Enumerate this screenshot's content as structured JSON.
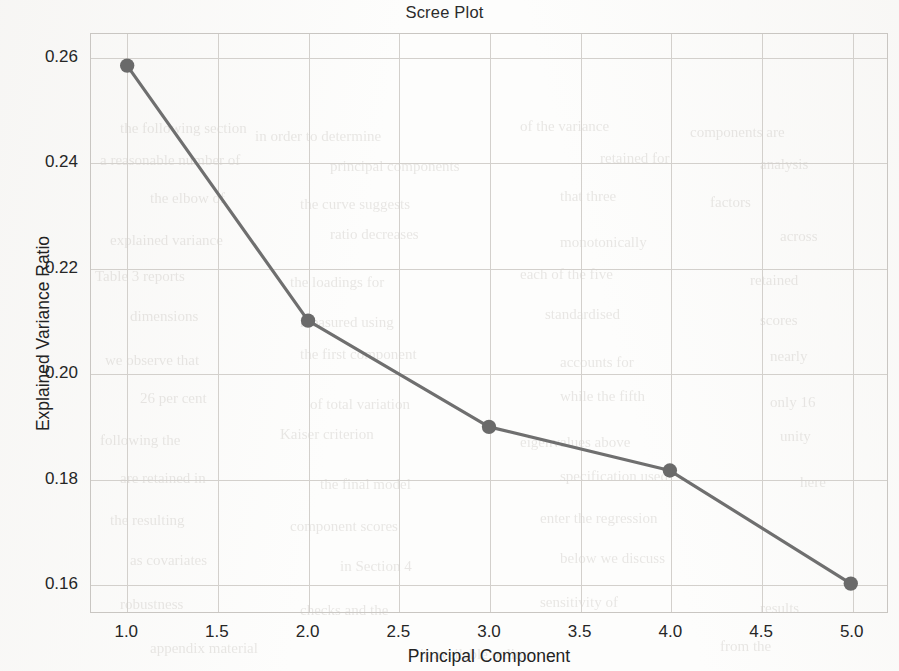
{
  "chart_data": {
    "type": "line",
    "title": "Scree Plot",
    "xlabel": "Principal Component",
    "ylabel": "Explained Variance Ratio",
    "x": [
      1,
      2,
      3,
      4,
      5
    ],
    "values": [
      0.2585,
      0.21,
      0.1898,
      0.1815,
      0.16
    ],
    "series": [
      {
        "name": "Explained Variance Ratio",
        "x": [
          1,
          2,
          3,
          4,
          5
        ],
        "values": [
          0.2585,
          0.21,
          0.1898,
          0.1815,
          0.16
        ]
      }
    ],
    "xlim": [
      0.8,
      5.2
    ],
    "ylim": [
      0.1545,
      0.2645
    ],
    "xticks": [
      1.0,
      1.5,
      2.0,
      2.5,
      3.0,
      3.5,
      4.0,
      4.5,
      5.0
    ],
    "xtick_labels": [
      "1.0",
      "1.5",
      "2.0",
      "2.5",
      "3.0",
      "3.5",
      "4.0",
      "4.5",
      "5.0"
    ],
    "yticks": [
      0.16,
      0.18,
      0.2,
      0.22,
      0.24,
      0.26
    ],
    "ytick_labels": [
      "0.16",
      "0.18",
      "0.20",
      "0.22",
      "0.24",
      "0.26"
    ],
    "grid": true,
    "legend": false,
    "marker": "circle",
    "line_color": "#6f6f6f",
    "marker_color": "#6a6a6a",
    "grid_color": "#d3d0cc",
    "axes_color": "#c9c6c2",
    "text_color": "#262626"
  },
  "background_bleed": [
    {
      "text": "the following section",
      "x": 120,
      "y": 120,
      "size": 15,
      "rot": 0
    },
    {
      "text": "in order to determine",
      "x": 255,
      "y": 128,
      "size": 15,
      "rot": 0
    },
    {
      "text": "of the variance",
      "x": 520,
      "y": 118,
      "size": 15,
      "rot": 0
    },
    {
      "text": "components are",
      "x": 690,
      "y": 124,
      "size": 15,
      "rot": 0
    },
    {
      "text": "a reasonable number of",
      "x": 100,
      "y": 152,
      "size": 15,
      "rot": 0
    },
    {
      "text": "principal components",
      "x": 330,
      "y": 158,
      "size": 15,
      "rot": 0
    },
    {
      "text": "retained for",
      "x": 600,
      "y": 150,
      "size": 15,
      "rot": 0
    },
    {
      "text": "analysis",
      "x": 760,
      "y": 156,
      "size": 15,
      "rot": 0
    },
    {
      "text": "the elbow of",
      "x": 150,
      "y": 190,
      "size": 15,
      "rot": 0
    },
    {
      "text": "the curve suggests",
      "x": 300,
      "y": 196,
      "size": 15,
      "rot": 0
    },
    {
      "text": "that three",
      "x": 560,
      "y": 188,
      "size": 15,
      "rot": 0
    },
    {
      "text": "factors",
      "x": 710,
      "y": 194,
      "size": 15,
      "rot": 0
    },
    {
      "text": "explained variance",
      "x": 110,
      "y": 232,
      "size": 15,
      "rot": 0
    },
    {
      "text": "ratio decreases",
      "x": 330,
      "y": 226,
      "size": 15,
      "rot": 0
    },
    {
      "text": "monotonically",
      "x": 560,
      "y": 234,
      "size": 15,
      "rot": 0
    },
    {
      "text": "across",
      "x": 780,
      "y": 228,
      "size": 15,
      "rot": 0
    },
    {
      "text": "Table 3 reports",
      "x": 95,
      "y": 268,
      "size": 15,
      "rot": 0
    },
    {
      "text": "the loadings for",
      "x": 290,
      "y": 274,
      "size": 15,
      "rot": 0
    },
    {
      "text": "each of the five",
      "x": 520,
      "y": 266,
      "size": 15,
      "rot": 0
    },
    {
      "text": "retained",
      "x": 750,
      "y": 272,
      "size": 15,
      "rot": 0
    },
    {
      "text": "dimensions",
      "x": 130,
      "y": 308,
      "size": 15,
      "rot": 0
    },
    {
      "text": "measured using",
      "x": 300,
      "y": 314,
      "size": 15,
      "rot": 0
    },
    {
      "text": "standardised",
      "x": 545,
      "y": 306,
      "size": 15,
      "rot": 0
    },
    {
      "text": "scores",
      "x": 760,
      "y": 312,
      "size": 15,
      "rot": 0
    },
    {
      "text": "we observe that",
      "x": 105,
      "y": 352,
      "size": 15,
      "rot": 0
    },
    {
      "text": "the first component",
      "x": 300,
      "y": 346,
      "size": 15,
      "rot": 0
    },
    {
      "text": "accounts for",
      "x": 560,
      "y": 354,
      "size": 15,
      "rot": 0
    },
    {
      "text": "nearly",
      "x": 770,
      "y": 348,
      "size": 15,
      "rot": 0
    },
    {
      "text": "26 per cent",
      "x": 140,
      "y": 390,
      "size": 15,
      "rot": 0
    },
    {
      "text": "of total variation",
      "x": 310,
      "y": 396,
      "size": 15,
      "rot": 0
    },
    {
      "text": "while the fifth",
      "x": 560,
      "y": 388,
      "size": 15,
      "rot": 0
    },
    {
      "text": "only 16",
      "x": 770,
      "y": 394,
      "size": 15,
      "rot": 0
    },
    {
      "text": "following the",
      "x": 100,
      "y": 432,
      "size": 15,
      "rot": 0
    },
    {
      "text": "Kaiser criterion",
      "x": 280,
      "y": 426,
      "size": 15,
      "rot": 0
    },
    {
      "text": "eigenvalues above",
      "x": 520,
      "y": 434,
      "size": 15,
      "rot": 0
    },
    {
      "text": "unity",
      "x": 780,
      "y": 428,
      "size": 15,
      "rot": 0
    },
    {
      "text": "are retained in",
      "x": 120,
      "y": 470,
      "size": 15,
      "rot": 0
    },
    {
      "text": "the final model",
      "x": 320,
      "y": 476,
      "size": 15,
      "rot": 0
    },
    {
      "text": "specification used",
      "x": 560,
      "y": 468,
      "size": 15,
      "rot": 0
    },
    {
      "text": "here",
      "x": 800,
      "y": 474,
      "size": 15,
      "rot": 0
    },
    {
      "text": "the resulting",
      "x": 110,
      "y": 512,
      "size": 15,
      "rot": 0
    },
    {
      "text": "component scores",
      "x": 290,
      "y": 518,
      "size": 15,
      "rot": 0
    },
    {
      "text": "enter the regression",
      "x": 540,
      "y": 510,
      "size": 15,
      "rot": 0
    },
    {
      "text": "as covariates",
      "x": 130,
      "y": 552,
      "size": 15,
      "rot": 0
    },
    {
      "text": "in Section 4",
      "x": 340,
      "y": 558,
      "size": 15,
      "rot": 0
    },
    {
      "text": "below we discuss",
      "x": 560,
      "y": 550,
      "size": 15,
      "rot": 0
    },
    {
      "text": "robustness",
      "x": 120,
      "y": 596,
      "size": 15,
      "rot": 0
    },
    {
      "text": "checks and the",
      "x": 300,
      "y": 602,
      "size": 15,
      "rot": 0
    },
    {
      "text": "sensitivity of",
      "x": 540,
      "y": 594,
      "size": 15,
      "rot": 0
    },
    {
      "text": "results",
      "x": 760,
      "y": 600,
      "size": 15,
      "rot": 0
    },
    {
      "text": "appendix material",
      "x": 150,
      "y": 640,
      "size": 15,
      "rot": 0
    },
    {
      "text": "is available online",
      "x": 420,
      "y": 646,
      "size": 15,
      "rot": 0
    },
    {
      "text": "from the",
      "x": 720,
      "y": 638,
      "size": 15,
      "rot": 0
    }
  ]
}
